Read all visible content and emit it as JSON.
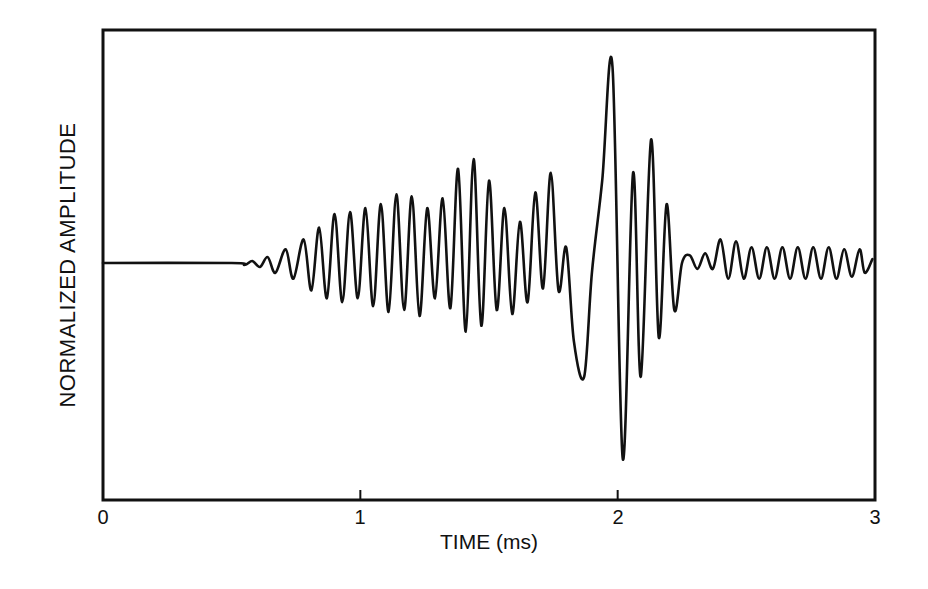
{
  "chart_data": {
    "type": "line",
    "title": "",
    "xlabel": "TIME (ms)",
    "ylabel": "NORMALIZED AMPLITUDE",
    "xlim": [
      0,
      3
    ],
    "ylim": [
      -1.2,
      1.2
    ],
    "grid": false,
    "legend": null,
    "x_ticks": [
      "0",
      "1",
      "2",
      "3"
    ],
    "y_ticks": [],
    "zero_line_tick": true,
    "series": [
      {
        "name": "waveform",
        "color": "#111111",
        "points": [
          [
            0.0,
            0.0
          ],
          [
            0.5,
            0.0
          ],
          [
            0.55,
            -0.01
          ],
          [
            0.58,
            0.01
          ],
          [
            0.61,
            -0.02
          ],
          [
            0.64,
            0.03
          ],
          [
            0.67,
            -0.05
          ],
          [
            0.71,
            0.07
          ],
          [
            0.74,
            -0.08
          ],
          [
            0.78,
            0.12
          ],
          [
            0.81,
            -0.14
          ],
          [
            0.84,
            0.18
          ],
          [
            0.87,
            -0.18
          ],
          [
            0.9,
            0.25
          ],
          [
            0.93,
            -0.2
          ],
          [
            0.96,
            0.26
          ],
          [
            0.99,
            -0.18
          ],
          [
            1.02,
            0.28
          ],
          [
            1.05,
            -0.22
          ],
          [
            1.08,
            0.3
          ],
          [
            1.11,
            -0.25
          ],
          [
            1.14,
            0.35
          ],
          [
            1.17,
            -0.24
          ],
          [
            1.2,
            0.34
          ],
          [
            1.23,
            -0.27
          ],
          [
            1.26,
            0.28
          ],
          [
            1.29,
            -0.18
          ],
          [
            1.32,
            0.33
          ],
          [
            1.35,
            -0.23
          ],
          [
            1.38,
            0.48
          ],
          [
            1.41,
            -0.35
          ],
          [
            1.44,
            0.53
          ],
          [
            1.47,
            -0.32
          ],
          [
            1.5,
            0.42
          ],
          [
            1.53,
            -0.24
          ],
          [
            1.56,
            0.28
          ],
          [
            1.59,
            -0.26
          ],
          [
            1.62,
            0.21
          ],
          [
            1.65,
            -0.2
          ],
          [
            1.68,
            0.36
          ],
          [
            1.71,
            -0.13
          ],
          [
            1.74,
            0.46
          ],
          [
            1.77,
            -0.14
          ],
          [
            1.8,
            0.08
          ],
          [
            1.83,
            -0.4
          ],
          [
            1.87,
            -0.58
          ],
          [
            1.9,
            -0.05
          ],
          [
            1.94,
            0.42
          ],
          [
            1.98,
            1.0
          ],
          [
            2.02,
            -1.0
          ],
          [
            2.06,
            0.46
          ],
          [
            2.09,
            -0.58
          ],
          [
            2.13,
            0.63
          ],
          [
            2.16,
            -0.38
          ],
          [
            2.19,
            0.3
          ],
          [
            2.22,
            -0.24
          ],
          [
            2.25,
            0.0
          ],
          [
            2.28,
            0.04
          ],
          [
            2.31,
            -0.03
          ],
          [
            2.34,
            0.05
          ],
          [
            2.37,
            -0.03
          ],
          [
            2.4,
            0.12
          ],
          [
            2.43,
            -0.08
          ],
          [
            2.46,
            0.11
          ],
          [
            2.49,
            -0.08
          ],
          [
            2.52,
            0.08
          ],
          [
            2.55,
            -0.08
          ],
          [
            2.58,
            0.08
          ],
          [
            2.61,
            -0.08
          ],
          [
            2.64,
            0.08
          ],
          [
            2.67,
            -0.08
          ],
          [
            2.7,
            0.08
          ],
          [
            2.73,
            -0.08
          ],
          [
            2.76,
            0.08
          ],
          [
            2.79,
            -0.08
          ],
          [
            2.82,
            0.08
          ],
          [
            2.85,
            -0.08
          ],
          [
            2.88,
            0.07
          ],
          [
            2.91,
            -0.07
          ],
          [
            2.94,
            0.07
          ],
          [
            2.96,
            -0.05
          ],
          [
            2.99,
            0.02
          ]
        ]
      }
    ]
  },
  "axes": {
    "ylabel": "NORMALIZED AMPLITUDE",
    "xlabel": "TIME (ms)",
    "ticks": [
      "0",
      "1",
      "2",
      "3"
    ]
  }
}
